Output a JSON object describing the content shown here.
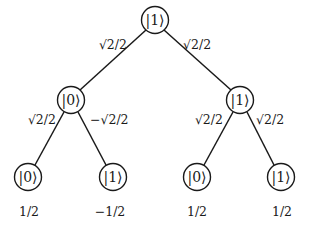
{
  "diagram": {
    "type": "probability-amplitude-tree",
    "nodes": {
      "root": {
        "label": "|1⟩",
        "x": 155,
        "y": 20
      },
      "mid_left": {
        "label": "|0⟩",
        "x": 71,
        "y": 100
      },
      "mid_right": {
        "label": "|1⟩",
        "x": 240,
        "y": 100
      },
      "leaf_1": {
        "label": "|0⟩",
        "x": 28,
        "y": 177
      },
      "leaf_2": {
        "label": "|1⟩",
        "x": 113,
        "y": 177
      },
      "leaf_3": {
        "label": "|0⟩",
        "x": 197,
        "y": 177
      },
      "leaf_4": {
        "label": "|1⟩",
        "x": 281,
        "y": 177
      }
    },
    "edges": {
      "root_to_mid_left": {
        "label": "√2/2"
      },
      "root_to_mid_right": {
        "label": "√2/2"
      },
      "mid_left_to_leaf_1": {
        "label": "√2/2"
      },
      "mid_left_to_leaf_2": {
        "label": "−√2/2"
      },
      "mid_right_to_leaf_3": {
        "label": "√2/2"
      },
      "mid_right_to_leaf_4": {
        "label": "√2/2"
      }
    },
    "amplitudes": {
      "leaf_1": "1/2",
      "leaf_2": "−1/2",
      "leaf_3": "1/2",
      "leaf_4": "1/2"
    }
  }
}
